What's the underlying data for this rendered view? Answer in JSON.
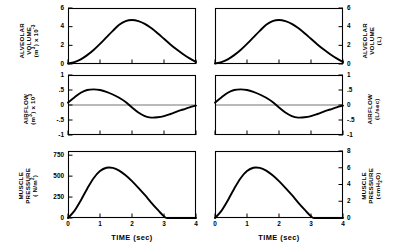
{
  "figure": {
    "background": "#ffffff",
    "ink": "#000000",
    "curve_color": "#000000",
    "axis_color": "#000000"
  },
  "axes": {
    "x": {
      "label": "TIME (sec)",
      "ticks": [
        "0",
        "1",
        "2",
        "3",
        "4"
      ],
      "min": 0,
      "max": 4
    }
  },
  "columns": [
    {
      "id": "si",
      "side": "left"
    },
    {
      "id": "clinical",
      "side": "right"
    }
  ],
  "panels": [
    {
      "id": "alveolar-volume-si",
      "row": 0,
      "column": "si",
      "ylabel_lines": [
        "ALVEOLAR",
        "VOLUME",
        "(m3) x 10-3"
      ],
      "yticks": [
        "0",
        "2",
        "4",
        "6"
      ],
      "xticks": [
        "0",
        "1",
        "2",
        "3",
        "4"
      ],
      "xlabel": "TIME (sec)"
    },
    {
      "id": "alveolar-volume-clinical",
      "row": 0,
      "column": "clinical",
      "ylabel_lines": [
        "ALVEOLAR",
        "VOLUME",
        "(L)"
      ],
      "yticks": [
        "0",
        "2",
        "4",
        "6"
      ],
      "xticks": [
        "0",
        "1",
        "2",
        "3",
        "4"
      ],
      "xlabel": "TIME (sec)"
    },
    {
      "id": "airflow-si",
      "row": 1,
      "column": "si",
      "ylabel_lines": [
        "AIRFLOW",
        "(m3) x 103"
      ],
      "yticks": [
        "-1",
        "-.5",
        "0",
        ".5",
        "1"
      ],
      "xticks": [
        "0",
        "1",
        "2",
        "3",
        "4"
      ],
      "xlabel": "TIME (sec)"
    },
    {
      "id": "airflow-clinical",
      "row": 1,
      "column": "clinical",
      "ylabel_lines": [
        "AIRFLOW",
        "(L/sec)"
      ],
      "yticks": [
        "-1",
        "-.5",
        "0",
        ".5",
        "1"
      ],
      "xticks": [
        "0",
        "1",
        "2",
        "3",
        "4"
      ],
      "xlabel": "TIME (sec)"
    },
    {
      "id": "muscle-pressure-si",
      "row": 2,
      "column": "si",
      "ylabel_lines": [
        "MUSCLE",
        "PRESSURE",
        "( N/m2)"
      ],
      "yticks": [
        "0",
        "250",
        "500",
        "750"
      ],
      "xticks": [
        "0",
        "1",
        "2",
        "3",
        "4"
      ],
      "xlabel": "TIME (sec)"
    },
    {
      "id": "muscle-pressure-clinical",
      "row": 2,
      "column": "clinical",
      "ylabel_lines": [
        "MUSCLE",
        "PRESSURE",
        "(cmH2O)"
      ],
      "yticks": [
        "0",
        "2",
        "4",
        "6",
        "8"
      ],
      "xticks": [
        "0",
        "1",
        "2",
        "3",
        "4"
      ],
      "xlabel": "TIME (sec)"
    }
  ],
  "chart_data": [
    {
      "type": "line",
      "id": "alveolar-volume-si",
      "title": "",
      "xlabel": "TIME (sec)",
      "ylabel": "ALVEOLAR VOLUME (m3) x 10-3",
      "xlim": [
        0,
        4
      ],
      "ylim": [
        0,
        6
      ],
      "xticks": [
        0,
        1,
        2,
        3,
        4
      ],
      "yticks": [
        0,
        2,
        4,
        6
      ],
      "grid": false,
      "legend": "none",
      "x": [
        0,
        0.2,
        0.4,
        0.6,
        0.8,
        1.0,
        1.2,
        1.4,
        1.6,
        1.8,
        2.0,
        2.2,
        2.4,
        2.6,
        2.8,
        3.0,
        3.2,
        3.4,
        3.6,
        3.8,
        4.0
      ],
      "y": [
        0.05,
        0.2,
        0.5,
        0.95,
        1.5,
        2.15,
        2.85,
        3.55,
        4.2,
        4.6,
        4.72,
        4.6,
        4.3,
        3.85,
        3.3,
        2.7,
        2.1,
        1.55,
        1.05,
        0.6,
        0.22
      ]
    },
    {
      "type": "line",
      "id": "alveolar-volume-clinical",
      "title": "",
      "xlabel": "TIME (sec)",
      "ylabel": "ALVEOLAR VOLUME (L)",
      "xlim": [
        0,
        4
      ],
      "ylim": [
        0,
        6
      ],
      "xticks": [
        0,
        1,
        2,
        3,
        4
      ],
      "yticks": [
        0,
        2,
        4,
        6
      ],
      "grid": false,
      "legend": "none",
      "x": [
        0,
        0.2,
        0.4,
        0.6,
        0.8,
        1.0,
        1.2,
        1.4,
        1.6,
        1.8,
        2.0,
        2.2,
        2.4,
        2.6,
        2.8,
        3.0,
        3.2,
        3.4,
        3.6,
        3.8,
        4.0
      ],
      "y": [
        0.05,
        0.2,
        0.5,
        0.95,
        1.5,
        2.15,
        2.85,
        3.55,
        4.2,
        4.6,
        4.72,
        4.6,
        4.3,
        3.85,
        3.3,
        2.7,
        2.1,
        1.55,
        1.05,
        0.6,
        0.22
      ]
    },
    {
      "type": "line",
      "id": "airflow-si",
      "title": "",
      "xlabel": "TIME (sec)",
      "ylabel": "AIRFLOW (m3) x 103",
      "xlim": [
        0,
        4
      ],
      "ylim": [
        -1,
        1
      ],
      "xticks": [
        0,
        1,
        2,
        3,
        4
      ],
      "yticks": [
        -1,
        -0.5,
        0,
        0.5,
        1
      ],
      "grid": false,
      "zero_line": true,
      "legend": "none",
      "x": [
        0,
        0.2,
        0.4,
        0.6,
        0.8,
        1.0,
        1.2,
        1.4,
        1.6,
        1.8,
        2.0,
        2.2,
        2.4,
        2.6,
        2.8,
        3.0,
        3.2,
        3.4,
        3.6,
        3.8,
        4.0
      ],
      "y": [
        0.08,
        0.25,
        0.41,
        0.5,
        0.52,
        0.5,
        0.44,
        0.35,
        0.24,
        0.1,
        -0.08,
        -0.25,
        -0.37,
        -0.42,
        -0.41,
        -0.37,
        -0.3,
        -0.22,
        -0.15,
        -0.08,
        -0.02
      ]
    },
    {
      "type": "line",
      "id": "airflow-clinical",
      "title": "",
      "xlabel": "TIME (sec)",
      "ylabel": "AIRFLOW (L/sec)",
      "xlim": [
        0,
        4
      ],
      "ylim": [
        -1,
        1
      ],
      "xticks": [
        0,
        1,
        2,
        3,
        4
      ],
      "yticks": [
        -1,
        -0.5,
        0,
        0.5,
        1
      ],
      "grid": false,
      "zero_line": true,
      "legend": "none",
      "x": [
        0,
        0.2,
        0.4,
        0.6,
        0.8,
        1.0,
        1.2,
        1.4,
        1.6,
        1.8,
        2.0,
        2.2,
        2.4,
        2.6,
        2.8,
        3.0,
        3.2,
        3.4,
        3.6,
        3.8,
        4.0
      ],
      "y": [
        0.08,
        0.25,
        0.41,
        0.5,
        0.52,
        0.5,
        0.44,
        0.35,
        0.24,
        0.1,
        -0.08,
        -0.25,
        -0.37,
        -0.42,
        -0.41,
        -0.37,
        -0.3,
        -0.22,
        -0.15,
        -0.08,
        -0.02
      ]
    },
    {
      "type": "line",
      "id": "muscle-pressure-si",
      "title": "",
      "xlabel": "TIME (sec)",
      "ylabel": "MUSCLE PRESSURE ( N/m2)",
      "xlim": [
        0,
        4
      ],
      "ylim": [
        0,
        800
      ],
      "xticks": [
        0,
        1,
        2,
        3,
        4
      ],
      "yticks": [
        0,
        250,
        500,
        750
      ],
      "grid": false,
      "legend": "none",
      "x": [
        0,
        0.2,
        0.4,
        0.6,
        0.8,
        1.0,
        1.2,
        1.4,
        1.6,
        1.8,
        2.0,
        2.2,
        2.4,
        2.6,
        2.8,
        3.0,
        3.1,
        3.4,
        3.7,
        4.0
      ],
      "y": [
        0,
        85,
        210,
        350,
        475,
        560,
        600,
        598,
        565,
        510,
        440,
        360,
        275,
        185,
        100,
        20,
        0,
        0,
        0,
        0
      ]
    },
    {
      "type": "line",
      "id": "muscle-pressure-clinical",
      "title": "",
      "xlabel": "TIME (sec)",
      "ylabel": "MUSCLE PRESSURE (cmH2O)",
      "xlim": [
        0,
        4
      ],
      "ylim": [
        0,
        8
      ],
      "xticks": [
        0,
        1,
        2,
        3,
        4
      ],
      "yticks": [
        0,
        2,
        4,
        6,
        8
      ],
      "grid": false,
      "legend": "none",
      "x": [
        0,
        0.2,
        0.4,
        0.6,
        0.8,
        1.0,
        1.2,
        1.4,
        1.6,
        1.8,
        2.0,
        2.2,
        2.4,
        2.6,
        2.8,
        3.0,
        3.1,
        3.4,
        3.7,
        4.0
      ],
      "y": [
        0,
        0.85,
        2.1,
        3.5,
        4.75,
        5.6,
        6.0,
        5.98,
        5.65,
        5.1,
        4.4,
        3.6,
        2.75,
        1.85,
        1.0,
        0.2,
        0,
        0,
        0,
        0
      ]
    }
  ]
}
